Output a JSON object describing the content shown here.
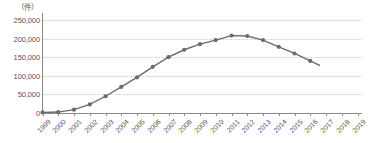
{
  "chart_data": {
    "type": "line",
    "title": "",
    "subtitle": "",
    "unit_label": "（件）",
    "xlabel": "",
    "ylabel": "",
    "ylim": [
      0,
      250000
    ],
    "xlim": [
      "1999",
      "2019"
    ],
    "grid": true,
    "legend": false,
    "series_color": "#6b6b6b",
    "marker": "circle",
    "categories": [
      "1999",
      "2000",
      "2001",
      "2002",
      "2003",
      "2004",
      "2005",
      "2006",
      "2007",
      "2008",
      "2009",
      "2010",
      "2011",
      "2012",
      "2013",
      "2014",
      "2015",
      "2016",
      "2017",
      "2018",
      "2019"
    ],
    "values": [
      1500,
      2500,
      9000,
      23000,
      45000,
      70000,
      96000,
      124000,
      150000,
      170000,
      185000,
      196000,
      208000,
      207000,
      196000,
      178000,
      160000,
      140000,
      120000,
      100000,
      78000
    ],
    "yticks": [
      0,
      50000,
      100000,
      150000,
      200000,
      250000
    ],
    "ytick_labels": [
      "0",
      "50,000",
      "100,000",
      "150,000",
      "200,000",
      "250,000"
    ]
  }
}
